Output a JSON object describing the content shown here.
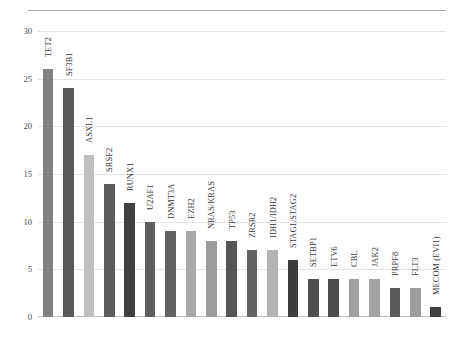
{
  "chart_data": {
    "type": "bar",
    "title": "",
    "subtitle": "",
    "xlabel": "",
    "ylabel": "",
    "ylim": [
      0,
      30
    ],
    "yticks": [
      0,
      5,
      10,
      15,
      20,
      25,
      30
    ],
    "grid": true,
    "legend": false,
    "orientation": "vertical",
    "category_label_rotation": -90,
    "categories": [
      "TET2",
      "SF3B1",
      "ASXL1",
      "SRSF2",
      "RUNX1",
      "U2AF1",
      "DNMT3A",
      "EZH2",
      "NRAS/KRAS",
      "TP53",
      "ZRSR2",
      "IDH1/IDH2",
      "STAG1/STAG2",
      "SETBP1",
      "ETV6",
      "CBL",
      "JAK2",
      "PRPF8",
      "FLT3",
      "MECOM (EVI1)"
    ],
    "values": [
      26,
      24,
      17,
      14,
      12,
      10,
      9,
      9,
      8,
      8,
      7,
      7,
      6,
      4,
      4,
      4,
      4,
      3,
      3,
      1
    ],
    "bar_colors": [
      "#808080",
      "#595959",
      "#bfbfbf",
      "#5b5b5b",
      "#404040",
      "#5e5e5e",
      "#636363",
      "#a9a9a9",
      "#9b9b9b",
      "#555555",
      "#636363",
      "#b3b3b3",
      "#3d3d3d",
      "#4f4f4f",
      "#4d4d4d",
      "#a0a0a0",
      "#a3a3a3",
      "#5a5a5a",
      "#9d9d9d",
      "#3f3f3f"
    ]
  },
  "axis": {
    "y_tick_labels": [
      "0",
      "5",
      "10",
      "15",
      "20",
      "25",
      "30"
    ]
  },
  "colors": {
    "gridline": "#e4e4e4",
    "axis": "#bdbdbd",
    "rule": "#a6a6a6",
    "text": "#3a3a3a",
    "background": "#ffffff"
  }
}
